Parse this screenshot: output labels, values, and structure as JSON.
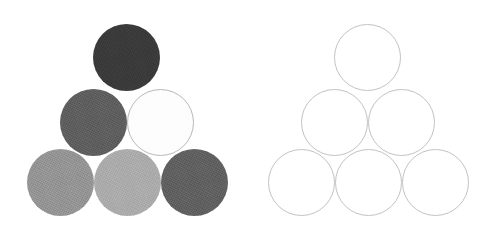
{
  "figure": {
    "title": "",
    "canvas": {
      "width": 501,
      "height": 236,
      "background": "#ffffff"
    },
    "panels": [
      {
        "id": "filled-pyramid",
        "name": "left-pyramid-filled",
        "style": "filled-grayscale",
        "circle_count": 6,
        "rows": [
          1,
          2,
          3
        ],
        "diameter": 67,
        "circles": [
          {
            "id": "f-top",
            "label": "top",
            "row": 1,
            "col": 1,
            "cx": 126,
            "cy": 57,
            "r": 33.5,
            "fill": "#3a3a3a",
            "stroke": "none",
            "stroke_width": 0,
            "tone": "very-dark-gray"
          },
          {
            "id": "f-mid-left",
            "label": "middle-left",
            "row": 2,
            "col": 1,
            "cx": 93,
            "cy": 122,
            "r": 33.5,
            "fill": "#5e5e5e",
            "stroke": "none",
            "stroke_width": 0,
            "tone": "dark-gray"
          },
          {
            "id": "f-mid-right",
            "label": "middle-right",
            "row": 2,
            "col": 2,
            "cx": 160,
            "cy": 122,
            "r": 33.5,
            "fill": "#fdfdfd",
            "stroke": "#b9b9b9",
            "stroke_width": 1.2,
            "tone": "white"
          },
          {
            "id": "f-bottom-left",
            "label": "bottom-left",
            "row": 3,
            "col": 1,
            "cx": 60,
            "cy": 182,
            "r": 33.5,
            "fill": "#949494",
            "stroke": "none",
            "stroke_width": 0,
            "tone": "medium-gray"
          },
          {
            "id": "f-bottom-mid",
            "label": "bottom-middle",
            "row": 3,
            "col": 2,
            "cx": 127,
            "cy": 182,
            "r": 33.5,
            "fill": "#ababab",
            "stroke": "none",
            "stroke_width": 0,
            "tone": "light-gray"
          },
          {
            "id": "f-bottom-right",
            "label": "bottom-right",
            "row": 3,
            "col": 3,
            "cx": 194,
            "cy": 182,
            "r": 33.5,
            "fill": "#606060",
            "stroke": "none",
            "stroke_width": 0,
            "tone": "dark-gray"
          }
        ]
      },
      {
        "id": "outline-pyramid",
        "name": "right-pyramid-outline",
        "style": "outline-only",
        "circle_count": 6,
        "rows": [
          1,
          2,
          3
        ],
        "diameter": 67,
        "circles": [
          {
            "id": "o-top",
            "label": "top",
            "row": 1,
            "col": 1,
            "cx": 367,
            "cy": 57,
            "r": 33.5,
            "fill": "none",
            "stroke": "#c3c3c3",
            "stroke_width": 1.3
          },
          {
            "id": "o-mid-left",
            "label": "middle-left",
            "row": 2,
            "col": 1,
            "cx": 334,
            "cy": 122,
            "r": 33.5,
            "fill": "none",
            "stroke": "#c3c3c3",
            "stroke_width": 1.3
          },
          {
            "id": "o-mid-right",
            "label": "middle-right",
            "row": 2,
            "col": 2,
            "cx": 401,
            "cy": 122,
            "r": 33.5,
            "fill": "none",
            "stroke": "#c3c3c3",
            "stroke_width": 1.3
          },
          {
            "id": "o-bottom-left",
            "label": "bottom-left",
            "row": 3,
            "col": 1,
            "cx": 301,
            "cy": 182,
            "r": 33.5,
            "fill": "none",
            "stroke": "#c3c3c3",
            "stroke_width": 1.3
          },
          {
            "id": "o-bottom-mid",
            "label": "bottom-middle",
            "row": 3,
            "col": 2,
            "cx": 368,
            "cy": 182,
            "r": 33.5,
            "fill": "none",
            "stroke": "#c3c3c3",
            "stroke_width": 1.3
          },
          {
            "id": "o-bottom-right",
            "label": "bottom-right",
            "row": 3,
            "col": 3,
            "cx": 435,
            "cy": 182,
            "r": 33.5,
            "fill": "none",
            "stroke": "#c3c3c3",
            "stroke_width": 1.3
          }
        ]
      }
    ],
    "palette": {
      "background": "#ffffff",
      "very_dark_gray": "#3a3a3a",
      "dark_gray": "#5e5e5e",
      "medium_gray": "#949494",
      "light_gray": "#ababab",
      "white": "#fdfdfd",
      "outline_gray": "#c3c3c3"
    }
  }
}
